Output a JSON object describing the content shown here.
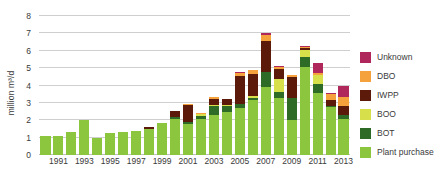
{
  "chart_data": {
    "type": "bar",
    "stacked": true,
    "title": "",
    "xlabel": "",
    "ylabel": "million m³/d",
    "ylim": [
      0,
      8
    ],
    "ytick_step": 1,
    "yticks": [
      0,
      1,
      2,
      3,
      4,
      5,
      6,
      7,
      8
    ],
    "grid": true,
    "legend_position": "right",
    "x": [
      1990,
      1991,
      1992,
      1993,
      1994,
      1995,
      1996,
      1997,
      1998,
      1999,
      2000,
      2001,
      2002,
      2003,
      2004,
      2005,
      2006,
      2007,
      2008,
      2009,
      2010,
      2011,
      2012,
      2013
    ],
    "xtick_labels": [
      "1991",
      "1993",
      "1995",
      "1997",
      "1999",
      "2001",
      "2003",
      "2005",
      "2007",
      "2009",
      "2011",
      "2013"
    ],
    "xtick_values": [
      1991,
      1993,
      1995,
      1997,
      1999,
      2001,
      2003,
      2005,
      2007,
      2009,
      2011,
      2013
    ],
    "series": [
      {
        "name": "Plant purchase",
        "color": "#8CC63E",
        "values": [
          1.1,
          1.12,
          1.3,
          2.02,
          0.97,
          1.24,
          1.3,
          1.4,
          1.47,
          1.82,
          2.08,
          1.78,
          2.1,
          2.28,
          2.5,
          2.72,
          3.15,
          3.9,
          3.3,
          2.02,
          5.05,
          3.55,
          2.75,
          2.1
        ]
      },
      {
        "name": "BOT",
        "color": "#2E6B26",
        "values": [
          0.0,
          0.0,
          0.0,
          0.0,
          0.0,
          0.0,
          0.05,
          0.0,
          0.05,
          0.05,
          0.1,
          0.1,
          0.15,
          0.55,
          0.3,
          0.2,
          0.15,
          0.9,
          0.3,
          1.28,
          0.6,
          0.52,
          0.05,
          0.22
        ]
      },
      {
        "name": "BOO",
        "color": "#D7E04A",
        "values": [
          0.0,
          0.0,
          0.0,
          0.0,
          0.0,
          0.0,
          0.0,
          0.0,
          0.0,
          0.0,
          0.0,
          0.0,
          0.1,
          0.05,
          0.1,
          0.0,
          0.1,
          0.0,
          0.8,
          0.0,
          0.4,
          0.55,
          0.0,
          0.0
        ]
      },
      {
        "name": "IWPP",
        "color": "#5C1A0B",
        "values": [
          0.0,
          0.0,
          0.0,
          0.0,
          0.0,
          0.0,
          0.0,
          0.0,
          0.1,
          0.0,
          0.35,
          1.0,
          0.0,
          0.35,
          0.35,
          1.65,
          1.25,
          1.75,
          0.55,
          1.18,
          0.1,
          0.0,
          0.38,
          0.52
        ]
      },
      {
        "name": "DBO",
        "color": "#F6A23C",
        "values": [
          0.0,
          0.0,
          0.0,
          0.0,
          0.0,
          0.0,
          0.0,
          0.0,
          0.0,
          0.0,
          0.0,
          0.05,
          0.05,
          0.1,
          0.0,
          0.18,
          0.25,
          0.35,
          0.1,
          0.1,
          0.05,
          0.1,
          0.35,
          0.48
        ]
      },
      {
        "name": "Unknown",
        "color": "#B0275C",
        "values": [
          0.0,
          0.0,
          0.0,
          0.0,
          0.0,
          0.0,
          0.0,
          0.0,
          0.0,
          0.0,
          0.0,
          0.0,
          0.0,
          0.0,
          0.0,
          0.05,
          0.0,
          0.1,
          0.05,
          0.0,
          0.05,
          0.55,
          0.05,
          0.68
        ]
      }
    ],
    "legend": [
      {
        "label": "Unknown",
        "color": "#B0275C"
      },
      {
        "label": "DBO",
        "color": "#F6A23C"
      },
      {
        "label": "IWPP",
        "color": "#5C1A0B"
      },
      {
        "label": "BOO",
        "color": "#D7E04A"
      },
      {
        "label": "BOT",
        "color": "#2E6B26"
      },
      {
        "label": "Plant purchase",
        "color": "#8CC63E"
      }
    ]
  }
}
